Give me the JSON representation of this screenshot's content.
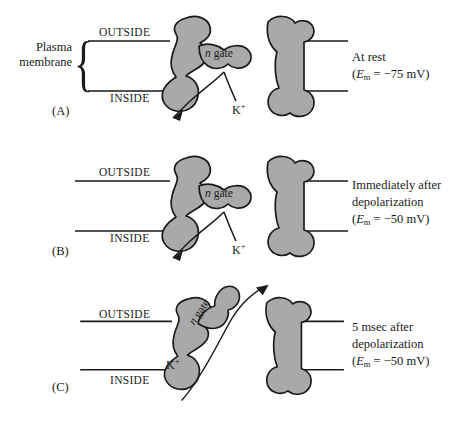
{
  "figure": {
    "protein_fill": "#a9a9a9",
    "protein_stroke": "#1a1a1a",
    "line_color": "#1a1a1a",
    "background": "#ffffff"
  },
  "common": {
    "outside_label": "OUTSIDE",
    "inside_label": "INSIDE",
    "gate_label_n": "n",
    "gate_label_word": "gate",
    "ion_label": "K",
    "ion_charge": "+",
    "plasma_line1": "Plasma",
    "plasma_line2": "membrane",
    "brace_glyph": "{"
  },
  "panels": [
    {
      "letter": "(A)",
      "state": "closed-at-rest",
      "outside": "OUTSIDE",
      "inside": "INSIDE",
      "gate_n": "n",
      "gate_word": "gate",
      "ion": "K",
      "ion_charge": "+",
      "caption_lines": [
        "At rest"
      ],
      "em_prefix": "(",
      "em_symbol": "E",
      "em_sub": "m",
      "em_equals": " = ",
      "em_value": "−75 mV",
      "em_suffix": ")",
      "em_full": "(Em = −75 mV)",
      "gate_open": false,
      "arrow_direction": "inward-blocked"
    },
    {
      "letter": "(B)",
      "state": "closed-immediately-after-depolarization",
      "outside": "OUTSIDE",
      "inside": "INSIDE",
      "gate_n": "n",
      "gate_word": "gate",
      "ion": "K",
      "ion_charge": "+",
      "caption_lines": [
        "Immediately after",
        "depolarization"
      ],
      "em_prefix": "(",
      "em_symbol": "E",
      "em_sub": "m",
      "em_equals": " = ",
      "em_value": "−50 mV",
      "em_suffix": ")",
      "em_full": "(Em = −50 mV)",
      "gate_open": false,
      "arrow_direction": "inward-blocked"
    },
    {
      "letter": "(C)",
      "state": "open-5-msec-after-depolarization",
      "outside": "OUTSIDE",
      "inside": "INSIDE",
      "gate_n": "n",
      "gate_word": "gate",
      "ion": "K",
      "ion_charge": "+",
      "caption_lines": [
        "5 msec after",
        "depolarization"
      ],
      "em_prefix": "(",
      "em_symbol": "E",
      "em_sub": "m",
      "em_equals": " = ",
      "em_value": "−50 mV",
      "em_suffix": ")",
      "em_full": "(Em = −50 mV)",
      "gate_open": true,
      "arrow_direction": "outward-through-pore"
    }
  ]
}
